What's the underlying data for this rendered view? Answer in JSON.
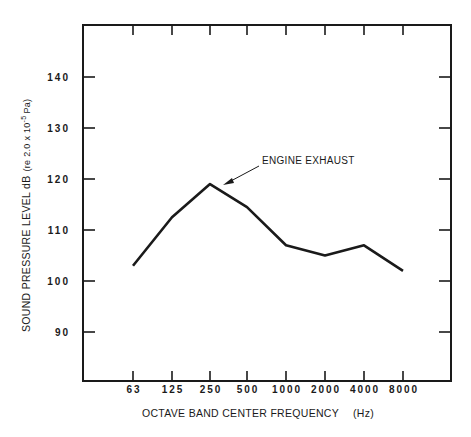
{
  "chart_data": {
    "type": "line",
    "title": "",
    "xlabel": "OCTAVE BAND CENTER FREQUENCY",
    "xlabel_unit": "(Hz)",
    "ylabel": "SOUND PRESSURE LEVEL dB",
    "ylabel_ref": "(re 2.0 x 10",
    "ylabel_exp": "-5",
    "ylabel_ref_unit": "Pa)",
    "categories": [
      "63",
      "125",
      "250",
      "500",
      "1000",
      "2000",
      "4000",
      "8000"
    ],
    "series": [
      {
        "name": "ENGINE EXHAUST",
        "values": [
          103,
          112.5,
          119,
          114.5,
          107,
          105,
          107,
          102
        ]
      }
    ],
    "yticks": [
      "90",
      "100",
      "110",
      "120",
      "130",
      "140"
    ],
    "ylim": [
      82,
      150
    ],
    "grid": false,
    "legend": "none",
    "annotations": [
      {
        "text": "ENGINE EXHAUST",
        "points_to": "250"
      }
    ]
  }
}
